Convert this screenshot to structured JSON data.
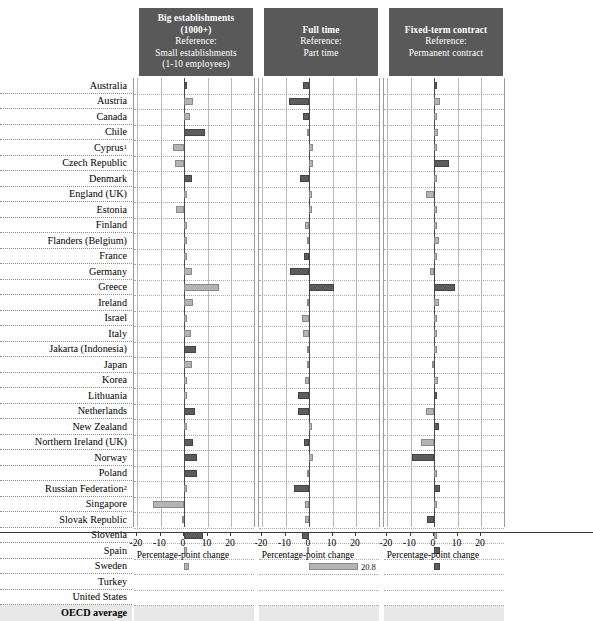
{
  "chart_data": {
    "type": "bar",
    "title": "",
    "orientation": "horizontal",
    "panels": [
      {
        "header_lines": [
          "Big establishments",
          "(1000+)",
          "Reference:",
          "Small establishments",
          "(1-10 employees)"
        ],
        "header_bold_lines": [
          0,
          1
        ],
        "xlabel": "Percentage-point change",
        "xlim": [
          -20,
          20
        ],
        "ticks": [
          -20,
          -10,
          0,
          10,
          20
        ],
        "values": [
          0.3,
          4.0,
          2.5,
          9.0,
          -4.5,
          -4.0,
          3.5,
          1.0,
          -3.5,
          0.4,
          0.3,
          0.4,
          3.5,
          15.0,
          4.0,
          0.4,
          3.0,
          5.0,
          3.5,
          1.0,
          1.0,
          4.5,
          0.5,
          4.0,
          5.5,
          5.5,
          1.0,
          -13.0,
          -0.5,
          8.0,
          0.3,
          2.0
        ],
        "shades": [
          "dk",
          "lt",
          "lt",
          "dk",
          "lt",
          "lt",
          "dk",
          "lt",
          "lt",
          "lt",
          "lt",
          "lt",
          "lt",
          "lt",
          "lt",
          "lt",
          "lt",
          "dk",
          "lt",
          "lt",
          "lt",
          "dk",
          "lt",
          "dk",
          "dk",
          "dk",
          "lt",
          "lt",
          "lt",
          "dk",
          "lt",
          "lt"
        ]
      },
      {
        "header_lines": [
          "Full time",
          "Reference:",
          "Part time"
        ],
        "header_bold_lines": [
          0
        ],
        "xlabel": "Percentage-point change",
        "xlim": [
          -20,
          20
        ],
        "ticks": [
          -20,
          -10,
          0,
          10,
          20
        ],
        "values": [
          -2.5,
          -8.5,
          -2.5,
          -1.0,
          1.5,
          1.5,
          -4.0,
          0.4,
          0.3,
          -1.5,
          -0.5,
          -2.0,
          -8.0,
          10.5,
          -0.5,
          -3.0,
          -2.5,
          -0.5,
          -0.5,
          -1.5,
          -4.5,
          -4.5,
          0.3,
          -2.0,
          1.5,
          -1.0,
          -6.5,
          -1.5,
          -1.5,
          -3.0,
          -1.0,
          20.8
        ],
        "shades": [
          "dk",
          "dk",
          "dk",
          "lt",
          "lt",
          "lt",
          "dk",
          "lt",
          "lt",
          "lt",
          "lt",
          "dk",
          "dk",
          "dk",
          "lt",
          "lt",
          "lt",
          "lt",
          "lt",
          "lt",
          "dk",
          "dk",
          "lt",
          "dk",
          "lt",
          "lt",
          "dk",
          "lt",
          "lt",
          "dk",
          "lt",
          "lt"
        ],
        "value_labels": {
          "31": "20.8"
        }
      },
      {
        "header_lines": [
          "Fixed-term contract",
          "Reference:",
          "Permanent contract"
        ],
        "header_bold_lines": [
          0
        ],
        "xlabel": "Percentage-point change",
        "xlim": [
          -20,
          20
        ],
        "ticks": [
          -20,
          -10,
          0,
          10,
          20
        ],
        "values": [
          0.4,
          2.5,
          0.5,
          1.5,
          0.5,
          6.5,
          0.4,
          -3.5,
          0.5,
          0.3,
          2.0,
          0.3,
          -1.5,
          9.0,
          2.0,
          0.5,
          0.3,
          0.5,
          -0.5,
          1.5,
          1.0,
          -3.5,
          2.0,
          -5.5,
          -9.5,
          0.5,
          2.5,
          0.4,
          -3.0,
          1.0,
          2.5,
          2.5
        ],
        "shades": [
          "dk",
          "lt",
          "lt",
          "lt",
          "lt",
          "dk",
          "lt",
          "lt",
          "lt",
          "lt",
          "lt",
          "lt",
          "lt",
          "dk",
          "lt",
          "lt",
          "lt",
          "lt",
          "lt",
          "lt",
          "dk",
          "lt",
          "dk",
          "lt",
          "dk",
          "lt",
          "dk",
          "lt",
          "dk",
          "lt",
          "dk",
          "dk"
        ]
      }
    ],
    "categories": [
      "Australia",
      "Austria",
      "Canada",
      "Chile",
      "Cyprus¹",
      "Czech Republic",
      "Denmark",
      "England (UK)",
      "Estonia",
      "Finland",
      "Flanders (Belgium)",
      "France",
      "Germany",
      "Greece",
      "Ireland",
      "Israel",
      "Italy",
      "Jakarta (Indonesia)",
      "Japan",
      "Korea",
      "Lithuania",
      "Netherlands",
      "New Zealand",
      "Northern Ireland (UK)",
      "Norway",
      "Poland",
      "Russian Federation²",
      "Singapore",
      "Slovak Republic",
      "Slovenia",
      "Spain",
      "Sweden",
      "Turkey",
      "United States",
      "OECD average"
    ],
    "colors": {
      "light_bar": "#b4b4b4",
      "dark_bar": "#5c5c5c",
      "header_bg": "#595959",
      "average_band": "#e8e8e8"
    }
  }
}
